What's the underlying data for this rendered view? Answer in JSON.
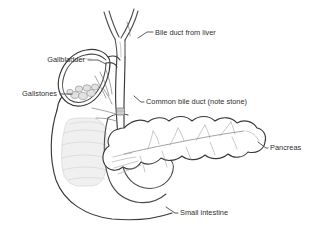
{
  "figure": {
    "type": "anatomical-line-drawing",
    "background_color": "#ffffff",
    "ink_color": "#4a4a4a",
    "text_color": "#2f2f2f",
    "ghost_color": "#f0f0f0",
    "stone_fill": "#e2e2e2"
  },
  "labels": [
    {
      "id": "bile-duct-from-liver",
      "text": "Bile duct from liver",
      "anchor": "start",
      "text_x": 155,
      "text_y": 33,
      "leader": "M 138 38 L 147 32 L 153 32"
    },
    {
      "id": "gallbladder",
      "text": "Gallbladder",
      "anchor": "end",
      "text_x": 85,
      "text_y": 60,
      "leader": "M 88 60 L 98 60 L 106 64"
    },
    {
      "id": "gallstones",
      "text": "Gallstones",
      "anchor": "end",
      "text_x": 57,
      "text_y": 94,
      "leader": "M 60 94 L 72 94"
    },
    {
      "id": "common-bile-duct",
      "text": "Common bile duct (note stone)",
      "anchor": "start",
      "text_x": 146,
      "text_y": 102,
      "leader": "M 134 96 L 141 102 L 144 102"
    },
    {
      "id": "pancreas",
      "text": "Pancreas",
      "anchor": "start",
      "text_x": 270,
      "text_y": 148,
      "leader": "M 258 142 L 266 148 L 268 148"
    },
    {
      "id": "small-intestine",
      "text": "Small intestine",
      "anchor": "start",
      "text_x": 180,
      "text_y": 213,
      "leader": "M 166 207 L 175 213 L 178 213"
    }
  ],
  "structures": {
    "hepatic_ducts": "branching Y-shaped bile ducts descending from liver",
    "gallbladder": "pear-shaped sac tilted diagonally, double-walled",
    "gallstone_count": 7,
    "common_bile_duct": "vertical tube with single impacted stone",
    "pancreas": "lobulated gland with branching pancreatic duct",
    "duodenum": "C-shaped loop of small intestine",
    "ghost_organ": "faint grey banded outline behind duodenum"
  }
}
